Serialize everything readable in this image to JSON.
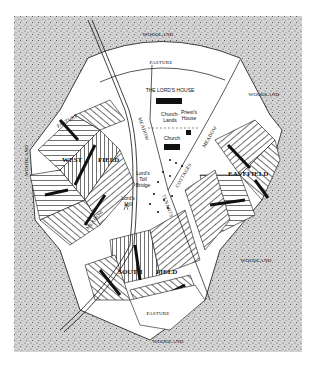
{
  "map": {
    "title": "Medieval Manor",
    "colors": {
      "woodland": "#c9c9c9",
      "open": "#ffffff",
      "ink": "#111111"
    },
    "labels": {
      "woodland_top": "WOODLAND",
      "woodland_right": "WOODLAND",
      "woodland_left": "WOODLAND",
      "woodland_se": "WOODLAND",
      "woodland_bottom": "WOODLAND",
      "pasture_top": "PASTURE",
      "pasture_left": "PASTURE",
      "pasture_bottom": "PASTURE",
      "lords_house": "THE LORD'S HOUSE",
      "church_lands_1": "Church-",
      "church_lands_2": "Lands",
      "priests_house_1": "Priest's",
      "priests_house_2": "House",
      "church": "Church",
      "meadow_nw": "MEADOW",
      "meadow_ne": "MEADOW",
      "meadow_sw": "MEADOW",
      "cottages": "COTTAGES",
      "tenants": "TENANTS",
      "toll_bridge_1": "Lord's",
      "toll_bridge_2": "Toll",
      "toll_bridge_3": "Bridge",
      "mill_1": "Lord's",
      "mill_2": "Mill",
      "west_field_1": "WEST",
      "west_field_2": "FIELD",
      "east_field_1": "EAST",
      "east_field_2": "FIELD",
      "south_field_1": "SOUTH",
      "south_field_2": "FIELD"
    }
  }
}
